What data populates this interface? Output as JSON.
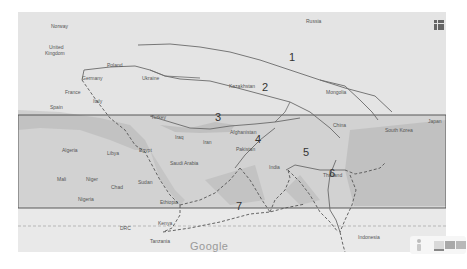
{
  "map": {
    "provider_logo": "Google",
    "colors": {
      "land": "#e6e6e6",
      "water": "#c9c9c9",
      "route_line": "#6a6a6a",
      "highlight_band": "#bdbdbd",
      "band_border": "#4a4a4a"
    },
    "country_labels": [
      {
        "name": "Norway",
        "x": 51,
        "y": 27
      },
      {
        "name": "Russia",
        "x": 306,
        "y": 22
      },
      {
        "name": "United",
        "x": 49,
        "y": 48
      },
      {
        "name": "Kingdom",
        "x": 45,
        "y": 54
      },
      {
        "name": "Poland",
        "x": 107,
        "y": 66
      },
      {
        "name": "Germany",
        "x": 82,
        "y": 79
      },
      {
        "name": "Ukraine",
        "x": 142,
        "y": 79
      },
      {
        "name": "Kazakhstan",
        "x": 229,
        "y": 87
      },
      {
        "name": "Mongolia",
        "x": 326,
        "y": 93
      },
      {
        "name": "France",
        "x": 65,
        "y": 93
      },
      {
        "name": "Italy",
        "x": 93,
        "y": 102
      },
      {
        "name": "Spain",
        "x": 50,
        "y": 108
      },
      {
        "name": "Turkey",
        "x": 151,
        "y": 118
      },
      {
        "name": "China",
        "x": 333,
        "y": 126
      },
      {
        "name": "South Korea",
        "x": 385,
        "y": 131
      },
      {
        "name": "Japan",
        "x": 428,
        "y": 122
      },
      {
        "name": "Iraq",
        "x": 175,
        "y": 138
      },
      {
        "name": "Iran",
        "x": 203,
        "y": 143
      },
      {
        "name": "Afghanistan",
        "x": 230,
        "y": 133
      },
      {
        "name": "Pakistan",
        "x": 236,
        "y": 150
      },
      {
        "name": "Algeria",
        "x": 62,
        "y": 151
      },
      {
        "name": "Libya",
        "x": 107,
        "y": 154
      },
      {
        "name": "Egypt",
        "x": 139,
        "y": 151
      },
      {
        "name": "Saudi Arabia",
        "x": 170,
        "y": 164
      },
      {
        "name": "India",
        "x": 269,
        "y": 168
      },
      {
        "name": "Mali",
        "x": 57,
        "y": 180
      },
      {
        "name": "Niger",
        "x": 86,
        "y": 180
      },
      {
        "name": "Chad",
        "x": 111,
        "y": 188
      },
      {
        "name": "Sudan",
        "x": 138,
        "y": 183
      },
      {
        "name": "Thailand",
        "x": 323,
        "y": 176
      },
      {
        "name": "Nigeria",
        "x": 78,
        "y": 200
      },
      {
        "name": "Ethiopia",
        "x": 160,
        "y": 203
      },
      {
        "name": "DRC",
        "x": 120,
        "y": 229
      },
      {
        "name": "Kenya",
        "x": 158,
        "y": 224
      },
      {
        "name": "Tanzania",
        "x": 150,
        "y": 242
      },
      {
        "name": "Indonesia",
        "x": 358,
        "y": 238
      }
    ],
    "route_labels": [
      {
        "id": "1",
        "x": 289,
        "y": 58
      },
      {
        "id": "2",
        "x": 262,
        "y": 88
      },
      {
        "id": "3",
        "x": 215,
        "y": 118
      },
      {
        "id": "4",
        "x": 255,
        "y": 140
      },
      {
        "id": "5",
        "x": 303,
        "y": 153
      },
      {
        "id": "6",
        "x": 329,
        "y": 174
      },
      {
        "id": "7",
        "x": 236,
        "y": 207
      }
    ],
    "controls": {
      "apps_icon": "grid-icon",
      "street_view_icon": "pegman-icon",
      "layer_options": [
        "map",
        "satellite",
        "terrain"
      ]
    }
  }
}
